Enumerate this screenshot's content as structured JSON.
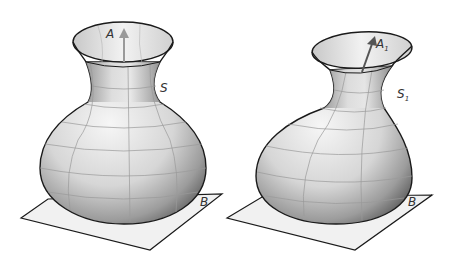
{
  "figures": [
    {
      "id": "left",
      "surface_label": "S",
      "axis_label": "A",
      "axis_subscript": "",
      "plane_label": "B",
      "axis_color": "#9a9a9a"
    },
    {
      "id": "right",
      "surface_label": "S",
      "surface_subscript": "1",
      "axis_label": "A",
      "axis_subscript": "1",
      "plane_label": "B",
      "axis_color": "#555555"
    }
  ],
  "colors": {
    "plane_fill": "#f1f1f1",
    "outline": "#1a1a1a",
    "grid": "#9a9a9a"
  }
}
